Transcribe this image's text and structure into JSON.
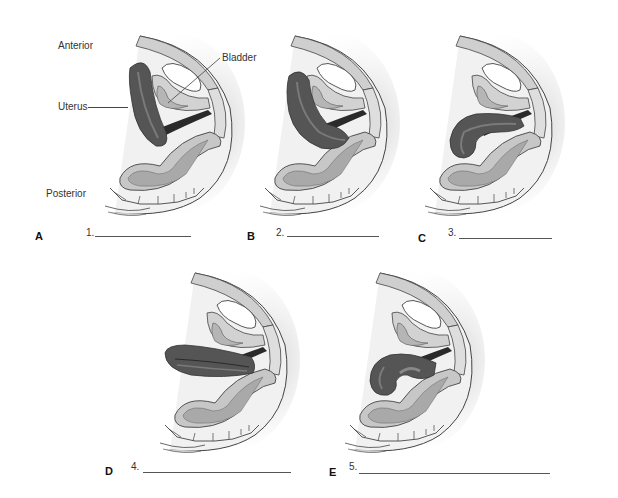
{
  "figure": {
    "labels": {
      "anterior": "Anterior",
      "posterior": "Posterior",
      "uterus": "Uterus",
      "bladder": "Bladder"
    },
    "panels": [
      {
        "letter": "A",
        "number": "1.",
        "answer": "",
        "uterus_position": "anteverted"
      },
      {
        "letter": "B",
        "number": "2.",
        "answer": "",
        "uterus_position": "anteflexed"
      },
      {
        "letter": "C",
        "number": "3.",
        "answer": "",
        "uterus_position": "retroverted"
      },
      {
        "letter": "D",
        "number": "4.",
        "answer": "",
        "uterus_position": "midposition"
      },
      {
        "letter": "E",
        "number": "5.",
        "answer": "",
        "uterus_position": "retroflexed"
      }
    ],
    "colors": {
      "uterus": "#555555",
      "uterus_highlight": "#7a7a7a",
      "tissue": "#d6d6d6",
      "bladder_fill": "#ffffff",
      "rectum": "#b8b8b8",
      "outline": "#444444",
      "shade": "#e8e8e8"
    }
  }
}
